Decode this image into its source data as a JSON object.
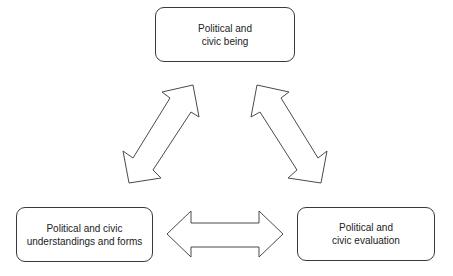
{
  "diagram": {
    "type": "triangular-cycle",
    "nodes": [
      {
        "id": "top",
        "lines": [
          "Political and",
          "civic being"
        ]
      },
      {
        "id": "left",
        "lines": [
          "Political and civic",
          "understandings and forms"
        ]
      },
      {
        "id": "right",
        "lines": [
          "Political and",
          "civic evaluation"
        ]
      }
    ],
    "edges": [
      {
        "from": "top",
        "to": "left",
        "style": "double-headed block arrow"
      },
      {
        "from": "top",
        "to": "right",
        "style": "double-headed block arrow"
      },
      {
        "from": "left",
        "to": "right",
        "style": "double-headed block arrow"
      }
    ],
    "colors": {
      "stroke": "#3a3a3a",
      "fill": "#ffffff",
      "text": "#222222"
    }
  }
}
